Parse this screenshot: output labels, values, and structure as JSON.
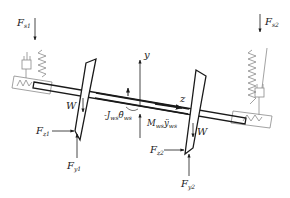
{
  "diagram": {
    "type": "free-body-diagram",
    "colors": {
      "stroke": "#1a1a1a",
      "suspension": "#8a8a8a",
      "background": "#ffffff"
    },
    "forces": {
      "fs1": {
        "base": "F",
        "sub": "s1",
        "direction": "down"
      },
      "fs2": {
        "base": "F",
        "sub": "s2",
        "direction": "down"
      },
      "fz1": {
        "base": "F",
        "sub": "z1",
        "direction": "right"
      },
      "fz2": {
        "base": "F",
        "sub": "z2",
        "direction": "right"
      },
      "fy1": {
        "base": "F",
        "sub": "y1",
        "direction": "up"
      },
      "fy2": {
        "base": "F",
        "sub": "y2",
        "direction": "up"
      },
      "w_left": {
        "base": "W",
        "direction": "down"
      },
      "w_right": {
        "base": "W",
        "direction": "down"
      }
    },
    "inertia": {
      "moment": {
        "prefix": "-J",
        "sub": "ws",
        "symbol": "θ̈",
        "symbol_sub": "ws"
      },
      "force": {
        "base": "M",
        "sub": "ws",
        "symbol": "ÿ",
        "symbol_sub": "ws"
      }
    },
    "axes": {
      "y": "y",
      "z": "z"
    }
  }
}
